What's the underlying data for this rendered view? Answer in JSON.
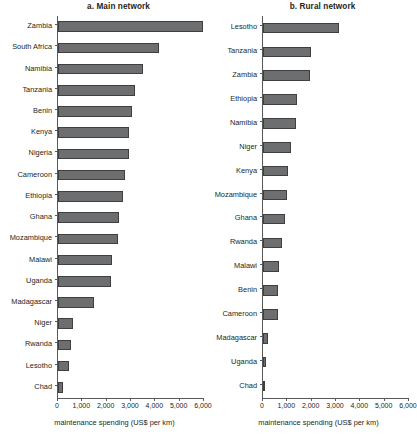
{
  "figure": {
    "width": 414,
    "height": 440,
    "bar_color": "#6d6e70",
    "bar_border_color": "#3f3f41",
    "axis_color": "#58595b",
    "text_color": "#231f20",
    "background": "#ffffff"
  },
  "chart_data": [
    {
      "type": "bar",
      "orientation": "horizontal",
      "title": "a. Main network",
      "xlabel": "maintenance spending  (US$ per km)",
      "ylabel": "",
      "xlim": [
        0,
        6000
      ],
      "xticks": [
        0,
        1000,
        2000,
        3000,
        4000,
        5000,
        6000
      ],
      "xticklabels": [
        "0",
        "1,000",
        "2,000",
        "3,000",
        "4,000",
        "5,000",
        "6,000"
      ],
      "grid": false,
      "legend": false,
      "categories": [
        "Zambia",
        "South Africa",
        "Namibia",
        "Tanzania",
        "Benin",
        "Kenya",
        "Nigeria",
        "Cameroon",
        "Ethiopia",
        "Ghana",
        "Mozambique",
        "Malawi",
        "Uganda",
        "Madagascar",
        "Niger",
        "Rwanda",
        "Lesotho",
        "Chad"
      ],
      "values": [
        5950,
        4150,
        3500,
        3170,
        3040,
        2920,
        2900,
        2760,
        2660,
        2510,
        2450,
        2200,
        2180,
        1470,
        620,
        530,
        450,
        210
      ]
    },
    {
      "type": "bar",
      "orientation": "horizontal",
      "title": "b. Rural network",
      "xlabel": "maintenance spending (US$ per km)",
      "ylabel": "",
      "xlim": [
        0,
        6000
      ],
      "xticks": [
        0,
        1000,
        2000,
        3000,
        4000,
        5000,
        6000
      ],
      "xticklabels": [
        "0",
        "1,000",
        "2,000",
        "3,000",
        "4,000",
        "5,000",
        "6,000"
      ],
      "grid": false,
      "legend": false,
      "categories": [
        "Lesotho",
        "Tanzania",
        "Zambia",
        "Ethiopia",
        "Namibia",
        "Niger",
        "Kenya",
        "Mozambique",
        "Ghana",
        "Rwanda",
        "Malawi",
        "Benin",
        "Cameroon",
        "Madagascar",
        "Uganda",
        "Chad"
      ],
      "values": [
        3120,
        1970,
        1930,
        1400,
        1360,
        1150,
        1030,
        990,
        900,
        780,
        660,
        620,
        600,
        200,
        120,
        20
      ]
    }
  ]
}
